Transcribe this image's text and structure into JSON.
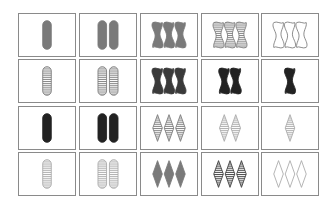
{
  "game": "set",
  "board": {
    "rows": 4,
    "cols": 5,
    "colors": {
      "gray": "#7a7a7a",
      "black": "#222222",
      "light": "#a8a8a8",
      "dark": "#3a3a3a"
    },
    "cards": [
      {
        "row": 0,
        "col": 0,
        "count": 1,
        "shape": "oval",
        "fill": "solid",
        "color": "gray"
      },
      {
        "row": 0,
        "col": 1,
        "count": 2,
        "shape": "oval",
        "fill": "solid",
        "color": "gray"
      },
      {
        "row": 0,
        "col": 2,
        "count": 3,
        "shape": "squiggle",
        "fill": "solid",
        "color": "gray"
      },
      {
        "row": 0,
        "col": 3,
        "count": 3,
        "shape": "squiggle",
        "fill": "striped",
        "color": "gray"
      },
      {
        "row": 0,
        "col": 4,
        "count": 3,
        "shape": "squiggle",
        "fill": "open",
        "color": "gray"
      },
      {
        "row": 1,
        "col": 0,
        "count": 1,
        "shape": "oval",
        "fill": "striped",
        "color": "gray"
      },
      {
        "row": 1,
        "col": 1,
        "count": 2,
        "shape": "oval",
        "fill": "striped",
        "color": "gray"
      },
      {
        "row": 1,
        "col": 2,
        "count": 3,
        "shape": "squiggle",
        "fill": "solid",
        "color": "dark"
      },
      {
        "row": 1,
        "col": 3,
        "count": 2,
        "shape": "squiggle",
        "fill": "solid",
        "color": "black"
      },
      {
        "row": 1,
        "col": 4,
        "count": 1,
        "shape": "squiggle",
        "fill": "solid",
        "color": "black"
      },
      {
        "row": 2,
        "col": 0,
        "count": 1,
        "shape": "oval",
        "fill": "solid",
        "color": "black"
      },
      {
        "row": 2,
        "col": 1,
        "count": 2,
        "shape": "oval",
        "fill": "solid",
        "color": "black"
      },
      {
        "row": 2,
        "col": 2,
        "count": 3,
        "shape": "diamond",
        "fill": "striped",
        "color": "gray"
      },
      {
        "row": 2,
        "col": 3,
        "count": 2,
        "shape": "diamond",
        "fill": "striped",
        "color": "light"
      },
      {
        "row": 2,
        "col": 4,
        "count": 1,
        "shape": "diamond",
        "fill": "striped",
        "color": "light"
      },
      {
        "row": 3,
        "col": 0,
        "count": 1,
        "shape": "oval",
        "fill": "striped",
        "color": "light"
      },
      {
        "row": 3,
        "col": 1,
        "count": 2,
        "shape": "oval",
        "fill": "striped",
        "color": "light"
      },
      {
        "row": 3,
        "col": 2,
        "count": 3,
        "shape": "diamond",
        "fill": "solid",
        "color": "gray"
      },
      {
        "row": 3,
        "col": 3,
        "count": 3,
        "shape": "diamond",
        "fill": "striped",
        "color": "dark"
      },
      {
        "row": 3,
        "col": 4,
        "count": 3,
        "shape": "diamond",
        "fill": "open",
        "color": "light"
      }
    ]
  }
}
